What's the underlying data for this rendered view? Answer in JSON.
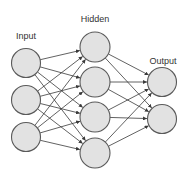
{
  "diagram": {
    "type": "neural-network",
    "colors": {
      "background": "#ffffff",
      "node_fill": "#e2e2e2",
      "node_stroke": "#5a5a5a",
      "edge": "#3a3a3a",
      "label": "#333333"
    },
    "layers": [
      {
        "id": "input",
        "label": "Input",
        "label_pos": [
          26,
          39
        ],
        "nodes": [
          [
            26,
            63
          ],
          [
            26,
            100
          ],
          [
            26,
            137
          ]
        ],
        "r": 14.5
      },
      {
        "id": "hidden",
        "label": "Hidden",
        "label_pos": [
          95,
          22
        ],
        "nodes": [
          [
            95,
            47
          ],
          [
            95,
            82
          ],
          [
            95,
            117
          ],
          [
            95,
            153
          ]
        ],
        "r": 15
      },
      {
        "id": "output",
        "label": "Output",
        "label_pos": [
          163,
          64
        ],
        "nodes": [
          [
            162,
            82
          ],
          [
            162,
            119
          ]
        ],
        "r": 14.5
      }
    ],
    "connectivity": "fully-connected with arrows between consecutive layers"
  }
}
